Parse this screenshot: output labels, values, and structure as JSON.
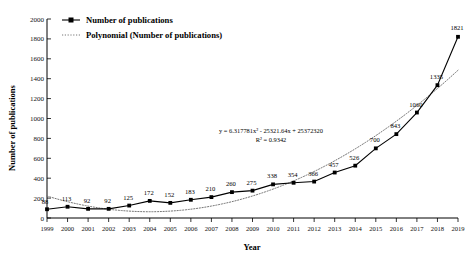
{
  "chart_data": {
    "type": "line",
    "title": "",
    "xlabel": "Year",
    "ylabel": "Number of publications",
    "categories": [
      "1999",
      "2000",
      "2001",
      "2002",
      "2003",
      "2004",
      "2005",
      "2006",
      "2007",
      "2008",
      "2009",
      "2010",
      "2011",
      "2012",
      "2013",
      "2014",
      "2015",
      "2016",
      "2017",
      "2018",
      "2019"
    ],
    "series": [
      {
        "name": "Number of publications",
        "type": "line-marker",
        "values": [
          88,
          113,
          92,
          92,
          125,
          172,
          152,
          183,
          210,
          260,
          275,
          338,
          354,
          366,
          457,
          526,
          700,
          843,
          1060,
          1335,
          1821
        ]
      },
      {
        "name": "Polynomial (Number of publications)",
        "type": "trendline-dotted",
        "equation": "y = 6.317781x² - 25321.64x + 25372320",
        "r_squared_label": "R² = 0.9342",
        "r_squared": 0.9342,
        "degree": 2,
        "coefficients": [
          6.317781,
          -25321.64,
          25372320
        ]
      }
    ],
    "data_labels": [
      "88",
      "113",
      "92",
      "92",
      "125",
      "172",
      "152",
      "183",
      "210",
      "260",
      "275",
      "338",
      "354",
      "366",
      "457",
      "526",
      "700",
      "843",
      "1060",
      "1335",
      "1821"
    ],
    "y_ticks": [
      0,
      200,
      400,
      600,
      800,
      1000,
      1200,
      1400,
      1600,
      1800,
      2000
    ],
    "y_tick_labels": [
      "0",
      "200",
      "400",
      "600",
      "800",
      "1000",
      "1200",
      "1400",
      "1600",
      "1800",
      "2000"
    ],
    "ylim": [
      0,
      2000
    ],
    "xlim": [
      "1999",
      "2019"
    ],
    "grid": false,
    "legend_position": "top-left",
    "legend": [
      {
        "label": "Number of publications",
        "marker": "line-with-square-marker",
        "color": "#000000"
      },
      {
        "label": "Polynomial (Number of publications)",
        "marker": "dotted-line",
        "color": "#666666"
      }
    ],
    "annotations": [
      {
        "name": "trendline-equation",
        "text": "y = 6.317781x² - 25321.64x + 25372320"
      },
      {
        "name": "trendline-r-squared",
        "text": "R² = 0.9342"
      }
    ]
  },
  "colors": {
    "series": "#000000",
    "trend": "#666666",
    "axis": "#000000",
    "background": "#ffffff"
  }
}
